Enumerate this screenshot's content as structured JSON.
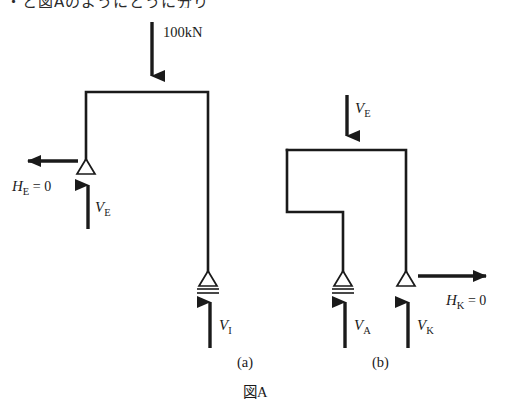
{
  "page": {
    "top_partial_text": "・と図Aのようにとうに分り",
    "caption": "図A",
    "background_color": "#ffffff",
    "ink_color": "#1a1a1a",
    "width": 522,
    "height": 413
  },
  "figure": {
    "caption": "図A",
    "panels": [
      {
        "id": "a",
        "sublabel": "(a)",
        "sublabel_x": 237,
        "sublabel_y": 367,
        "applied_load": {
          "name": "load-100kn",
          "label": "100kN",
          "label_x": 163,
          "label_y": 37,
          "direction": "down",
          "x": 152,
          "y_start": 22,
          "y_end": 90
        },
        "frame": {
          "name": "frame-a",
          "description": "L-shaped rigid frame: vertical left column, horizontal top beam, long right column",
          "points": "86,160 86,92 208,92 208,272"
        },
        "supports": [
          {
            "name": "support-pin-e",
            "type": "pin",
            "x": 86,
            "y": 160
          },
          {
            "name": "support-roller-i",
            "type": "roller",
            "x": 208,
            "y": 272
          }
        ],
        "reactions": [
          {
            "name": "reaction-he",
            "label_main": "H",
            "label_sub": "E",
            "label_eq": " = 0",
            "direction": "left",
            "x_start": 78,
            "x_end": 14,
            "y": 161,
            "label_x": 12,
            "label_y": 191
          },
          {
            "name": "reaction-ve",
            "label_main": "V",
            "label_sub": "E",
            "label_eq": "",
            "direction": "up",
            "x": 88,
            "y_start": 229,
            "y_end": 171,
            "label_x": 95,
            "label_y": 212
          },
          {
            "name": "reaction-vi",
            "label_main": "V",
            "label_sub": "I",
            "label_eq": "",
            "direction": "up",
            "x": 210,
            "y_start": 348,
            "y_end": 288,
            "label_x": 219,
            "label_y": 330
          }
        ]
      },
      {
        "id": "b",
        "sublabel": "(b)",
        "sublabel_x": 372,
        "sublabel_y": 367,
        "applied_load": {
          "name": "load-ve",
          "label_main": "V",
          "label_sub": "E",
          "label_x": 355,
          "label_y": 113,
          "direction": "down",
          "x": 347,
          "y_start": 95,
          "y_end": 150
        },
        "frame": {
          "name": "frame-b",
          "description": "Inverted U / stepped frame: short left stub, top beam, inner leg down to roller, right leg down to pin",
          "points": "287,150 287,212 343,212 343,272 M 287,150 406,150 406,272"
        },
        "supports": [
          {
            "name": "support-roller-a",
            "type": "roller",
            "x": 343,
            "y": 272
          },
          {
            "name": "support-pin-k",
            "type": "pin",
            "x": 406,
            "y": 272
          }
        ],
        "reactions": [
          {
            "name": "reaction-va",
            "label_main": "V",
            "label_sub": "A",
            "label_eq": "",
            "direction": "up",
            "x": 345,
            "y_start": 348,
            "y_end": 288,
            "label_x": 354,
            "label_y": 330
          },
          {
            "name": "reaction-vk",
            "label_main": "V",
            "label_sub": "K",
            "label_eq": "",
            "direction": "up",
            "x": 408,
            "y_start": 348,
            "y_end": 288,
            "label_x": 417,
            "label_y": 330
          },
          {
            "name": "reaction-hk",
            "label_main": "H",
            "label_sub": "K",
            "label_eq": " = 0",
            "direction": "right",
            "x_start": 418,
            "x_end": 500,
            "y": 276,
            "label_x": 446,
            "label_y": 305
          }
        ]
      }
    ]
  }
}
